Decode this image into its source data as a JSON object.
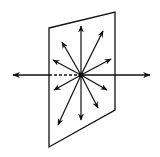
{
  "diagram": {
    "colors": {
      "background": "#ffffff",
      "stroke": "#111111"
    },
    "plane": {
      "points": [
        [
          49,
          28
        ],
        [
          115,
          12
        ],
        [
          115,
          110
        ],
        [
          49,
          147
        ]
      ]
    },
    "center": [
      81,
      75
    ],
    "axis": {
      "left_tip": [
        13,
        75
      ],
      "right_tip": [
        150,
        75
      ],
      "dashed_from": [
        49,
        75
      ],
      "dashed_to": [
        81,
        75
      ],
      "solid_left_to": [
        49,
        75
      ]
    },
    "radial_arrows": [
      {
        "name": "up",
        "tip": [
          81,
          26
        ]
      },
      {
        "name": "upper-right",
        "tip": [
          103,
          31
        ]
      },
      {
        "name": "right-up",
        "tip": [
          111,
          59
        ]
      },
      {
        "name": "upper-left",
        "tip": [
          62,
          42
        ]
      },
      {
        "name": "left-up",
        "tip": [
          53,
          60
        ]
      },
      {
        "name": "left-down",
        "tip": [
          54,
          90
        ]
      },
      {
        "name": "lower-left",
        "tip": [
          58,
          125
        ]
      },
      {
        "name": "down",
        "tip": [
          81,
          120
        ]
      },
      {
        "name": "lower-right",
        "tip": [
          98,
          108
        ]
      },
      {
        "name": "right-down",
        "tip": [
          107,
          90
        ]
      }
    ]
  }
}
